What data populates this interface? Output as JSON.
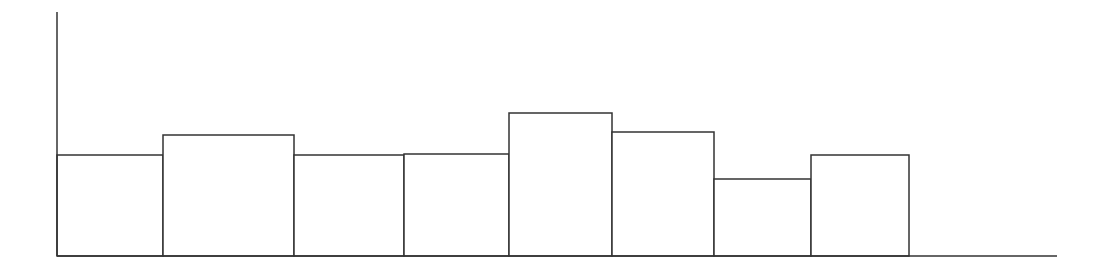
{
  "chart_data": {
    "type": "bar",
    "title": "",
    "xlabel": "",
    "ylabel": "",
    "grid": false,
    "legend": null,
    "categories": [
      "1",
      "2",
      "3",
      "4",
      "5",
      "6",
      "7",
      "8"
    ],
    "bar_edges_px": [
      57,
      163,
      294,
      404,
      509,
      612,
      714,
      811,
      909
    ],
    "values": [
      101,
      121,
      101,
      102,
      143,
      124,
      77,
      101
    ],
    "ylim": [
      0,
      244
    ]
  },
  "style": {
    "stroke": "#333333",
    "fill": "#ffffff"
  },
  "axes": {
    "origin_x": 57,
    "baseline_y": 256,
    "y_axis_top": 12,
    "x_axis_end": 1057
  }
}
